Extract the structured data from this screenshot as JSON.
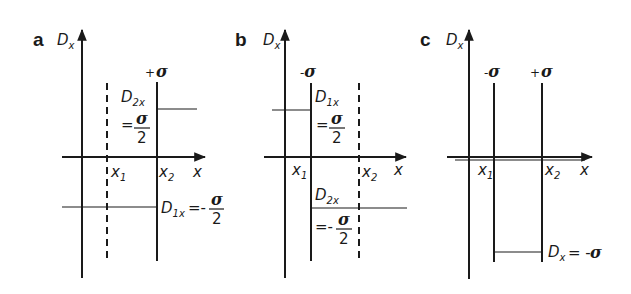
{
  "figure": {
    "panels": [
      {
        "letter": "a",
        "axis_label": "D",
        "axis_sub": "x",
        "x_axis_label": "x",
        "x1_label": "x",
        "x1_sub": "1",
        "x2_label": "x",
        "x2_sub": "2",
        "x1_style": "dashed",
        "x2_style": "solid",
        "x1_charge": "",
        "x2_charge_sign": "+",
        "x2_charge": "σ",
        "upper_label": "D",
        "upper_sub": "2x",
        "upper_eq": "=",
        "upper_num": "σ",
        "upper_den": "2",
        "lower_label": "D",
        "lower_sub": "1x",
        "lower_eq": "=-",
        "lower_num": "σ",
        "lower_den": "2"
      },
      {
        "letter": "b",
        "axis_label": "D",
        "axis_sub": "x",
        "x_axis_label": "x",
        "x1_label": "x",
        "x1_sub": "1",
        "x2_label": "x",
        "x2_sub": "2",
        "x1_style": "solid",
        "x2_style": "dashed",
        "x1_charge_sign": "-",
        "x1_charge": "σ",
        "upper_label": "D",
        "upper_sub": "1x",
        "upper_eq": "=",
        "upper_num": "σ",
        "upper_den": "2",
        "lower_label": "D",
        "lower_sub": "2x",
        "lower_eq": "=-",
        "lower_num": "σ",
        "lower_den": "2"
      },
      {
        "letter": "c",
        "axis_label": "D",
        "axis_sub": "x",
        "x_axis_label": "x",
        "x1_label": "x",
        "x1_sub": "1",
        "x2_label": "x",
        "x2_sub": "2",
        "x1_style": "solid",
        "x2_style": "solid",
        "x1_charge_sign": "-",
        "x1_charge": "σ",
        "x2_charge_sign": "+",
        "x2_charge": "σ",
        "lower_label": "D",
        "lower_sub": "x",
        "lower_eq": "= -",
        "lower_val": "σ"
      }
    ]
  }
}
